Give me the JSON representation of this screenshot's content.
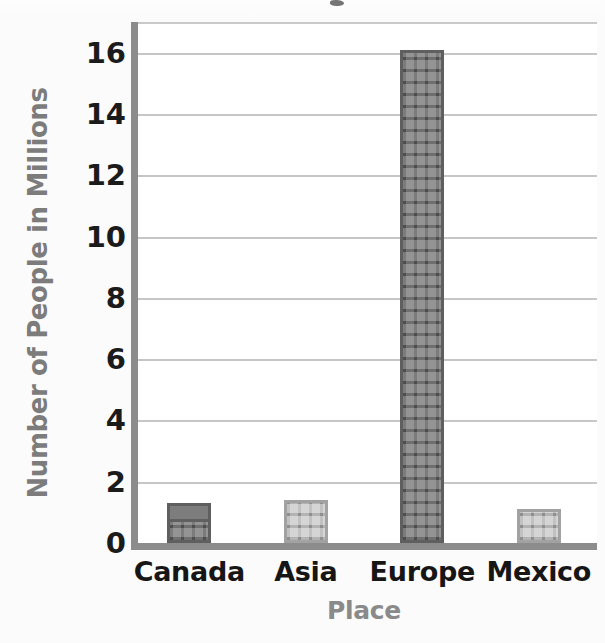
{
  "chart_data": {
    "type": "bar",
    "title": "",
    "xlabel": "Place",
    "ylabel": "Number of People in Millions",
    "categories": [
      "Canada",
      "Asia",
      "Europe",
      "Mexico"
    ],
    "values": [
      1.3,
      1.4,
      16.1,
      1.1
    ],
    "ylim": [
      0,
      17
    ],
    "yticks": [
      0,
      2,
      4,
      6,
      8,
      10,
      12,
      14,
      16
    ],
    "ytick_labels": [
      "0",
      "2",
      "4",
      "6",
      "8",
      "10",
      "12",
      "14",
      "16"
    ],
    "grid": true,
    "legend": "none",
    "series": [
      {
        "name": "Number of People in Millions",
        "values": [
          1.3,
          1.4,
          16.1,
          1.1
        ]
      }
    ],
    "bar_styles": [
      "dark-building",
      "light-building",
      "dark-building",
      "light-building"
    ],
    "colors": {
      "bar_dark": "#6f6f6f",
      "bar_dark_border": "#5f5f5f",
      "bar_light": "#b3b3b3",
      "bar_light_border": "#a2a2a2",
      "axis": "#8c8c8c",
      "gridline": "#c6c6c6",
      "tick_text": "#1b1b1b",
      "axis_title_text": "#8a8a8a",
      "plot_background": "#ffffff",
      "page_background": "#fbfbfb"
    }
  }
}
